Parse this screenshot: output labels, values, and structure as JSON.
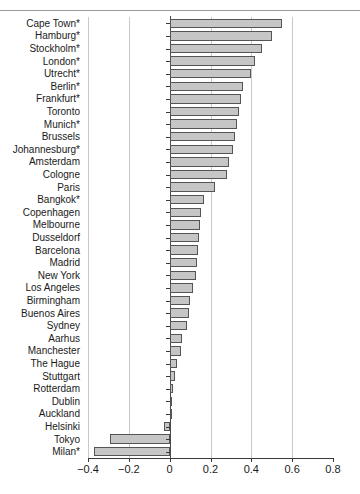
{
  "figure": {
    "top_partial_text": "",
    "axis": {
      "xlabel": "",
      "ylabel": "",
      "xlim": [
        -0.4,
        0.8
      ],
      "ticks": [
        -0.4,
        -0.2,
        0,
        0.2,
        0.4,
        0.6,
        0.8
      ],
      "tick_labels": [
        "−0.4",
        "−0.2",
        "0",
        "0.2",
        "0.4",
        "0.6",
        "0.8"
      ],
      "gridlines": [
        -0.4,
        -0.2,
        0.2,
        0.4,
        0.6
      ],
      "zero_line": 0
    },
    "style": {
      "bar_fill": "#c6c6c6",
      "bar_stroke": "#555555",
      "grid_color": "#c9c9c9",
      "axis_color": "#3a3a3a",
      "text_color": "#1a1a1a",
      "background": "#ffffff"
    }
  },
  "chart_data": {
    "type": "bar",
    "orientation": "horizontal",
    "title": "",
    "xlabel": "",
    "ylabel": "",
    "xlim": [
      -0.4,
      0.8
    ],
    "grid": true,
    "legend": "none",
    "categories": [
      "Cape Town*",
      "Hamburg*",
      "Stockholm*",
      "London*",
      "Utrecht*",
      "Berlin*",
      "Frankfurt*",
      "Toronto",
      "Munich*",
      "Brussels",
      "Johannesburg*",
      "Amsterdam",
      "Cologne",
      "Paris",
      "Bangkok*",
      "Copenhagen",
      "Melbourne",
      "Dusseldorf",
      "Barcelona",
      "Madrid",
      "New York",
      "Los Angeles",
      "Birmingham",
      "Buenos Aires",
      "Sydney",
      "Aarhus",
      "Manchester",
      "The Hague",
      "Stuttgart",
      "Rotterdam",
      "Dublin",
      "Auckland",
      "Helsinki",
      "Tokyo",
      "Milan*"
    ],
    "values": [
      0.55,
      0.5,
      0.45,
      0.42,
      0.4,
      0.36,
      0.35,
      0.34,
      0.33,
      0.32,
      0.31,
      0.29,
      0.28,
      0.22,
      0.17,
      0.155,
      0.15,
      0.145,
      0.14,
      0.135,
      0.13,
      0.115,
      0.1,
      0.095,
      0.085,
      0.06,
      0.055,
      0.035,
      0.025,
      0.015,
      0.012,
      0.008,
      -0.03,
      -0.29,
      -0.37
    ]
  }
}
